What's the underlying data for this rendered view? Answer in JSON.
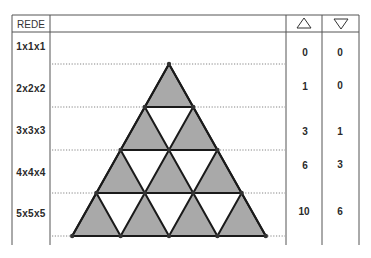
{
  "table": {
    "header": {
      "col1": "REDE",
      "col2": "",
      "col3_icon": "triangle-up-icon",
      "col4_icon": "triangle-down-icon"
    },
    "rows": [
      {
        "label": "1x1x1",
        "up": "0",
        "down": "0"
      },
      {
        "label": "2x2x2",
        "up": "1",
        "down": "0"
      },
      {
        "label": "3x3x3",
        "up": "3",
        "down": "1"
      },
      {
        "label": "4x4x4",
        "up": "6",
        "down": "3"
      },
      {
        "label": "5x5x5",
        "up": "10",
        "down": "6"
      }
    ]
  },
  "diagram": {
    "type": "triangular-grid",
    "rows": 4,
    "upward_triangles_fill": "#a9a9a9",
    "downward_triangles_fill": "#ffffff",
    "line_color": "#1a1a1a"
  },
  "colors": {
    "border": "#555555",
    "shade": "#a9a9a9"
  }
}
